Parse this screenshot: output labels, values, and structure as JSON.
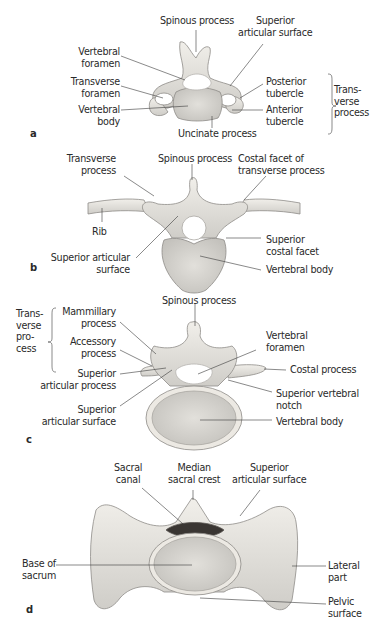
{
  "figure": {
    "panels": [
      {
        "letter": "a",
        "labels": {
          "spinous_process": "Spinous process",
          "superior_articular_surface": "Superior\narticular surface",
          "vertebral_foramen": "Vertebral\nforamen",
          "transverse_foramen": "Transverse\nforamen",
          "vertebral_body": "Vertebral\nbody",
          "posterior_tubercle": "Posterior\ntubercle",
          "anterior_tubercle": "Anterior\ntubercle",
          "uncinate_process": "Uncinate process",
          "transverse_process_group": "Trans-\nverse\nprocess"
        }
      },
      {
        "letter": "b",
        "labels": {
          "transverse_process": "Transverse\nprocess",
          "spinous_process": "Spinous process",
          "costal_facet_of_transverse_process": "Costal facet of\ntransverse process",
          "rib": "Rib",
          "superior_costal_facet": "Superior\ncostal facet",
          "superior_articular_surface": "Superior articular\nsurface",
          "vertebral_body": "Vertebral body"
        }
      },
      {
        "letter": "c",
        "labels": {
          "spinous_process": "Spinous process",
          "transverse_process_group": "Trans-\nverse\npro-\ncess",
          "mammillary_process": "Mammillary\nprocess",
          "accessory_process": "Accessory\nprocess",
          "vertebral_foramen": "Vertebral\nforamen",
          "costal_process": "Costal process",
          "superior_articular_process": "Superior\narticular process",
          "superior_vertebral_notch": "Superior vertebral\nnotch",
          "superior_articular_surface": "Superior\narticular surface",
          "vertebral_body": "Vertebral body"
        }
      },
      {
        "letter": "d",
        "labels": {
          "sacral_canal": "Sacral\ncanal",
          "median_sacral_crest": "Median\nsacral crest",
          "superior_articular_surface": "Superior\narticular surface",
          "base_of_sacrum": "Base of\nsacrum",
          "lateral_part": "Lateral\npart",
          "pelvic_surface": "Pelvic\nsurface"
        }
      }
    ],
    "colors": {
      "bone_fill": "#e8e6e1",
      "bone_shade": "#c9c7c2",
      "bone_outline": "#8e8c88",
      "body_fill": "#d6d4cf",
      "leader_line": "#3a3a3a",
      "text": "#2a2a2a"
    }
  }
}
